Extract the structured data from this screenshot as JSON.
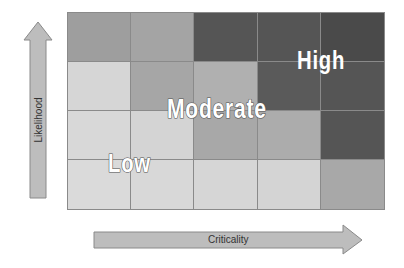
{
  "diagram": {
    "title": "",
    "type": "risk-matrix",
    "rows": 4,
    "columns": 5,
    "cell_colors": [
      [
        "#9e9e9e",
        "#a4a4a4",
        "#555555",
        "#555555",
        "#4a4a4a"
      ],
      [
        "#d6d6d6",
        "#a6a6a6",
        "#b0b0b0",
        "#5a5a5a",
        "#555555"
      ],
      [
        "#d8d8d8",
        "#d4d4d4",
        "#a8a8a8",
        "#acacac",
        "#555555"
      ],
      [
        "#dadada",
        "#d8d8d8",
        "#d6d6d6",
        "#d4d4d4",
        "#a8a8a8"
      ]
    ],
    "zones": {
      "low": "Low",
      "moderate": "Moderate",
      "high": "High"
    },
    "axes": {
      "y_label": "Likelihood",
      "x_label": "Criticality"
    },
    "colors": {
      "arrow_fill": "#bdbdbd",
      "arrow_stroke": "#8a8a8a",
      "grid_line": "#8a8a8a",
      "label_text": "#ffffff",
      "label_outline": "#555555"
    }
  }
}
